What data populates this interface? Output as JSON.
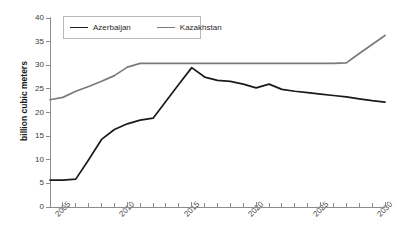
{
  "chart_data": {
    "type": "line",
    "title": "",
    "subtitle": "",
    "xlabel": "",
    "ylabel": "billion cubic meters",
    "xlim": [
      2004,
      2030
    ],
    "ylim": [
      0,
      40
    ],
    "yticks": [
      0,
      5,
      10,
      15,
      20,
      25,
      30,
      35,
      40
    ],
    "ytick_labels": [
      "0",
      "5",
      "10",
      "15",
      "20",
      "25",
      "30",
      "35",
      "40"
    ],
    "xticks": [
      2005,
      2010,
      2015,
      2020,
      2025,
      2030
    ],
    "xtick_labels": [
      "2005",
      "2010",
      "2015",
      "2020",
      "2025",
      "2030"
    ],
    "x_minor_tick_step": 1,
    "grid": false,
    "legend_position": "top-left-inside",
    "x": [
      2004,
      2005,
      2006,
      2007,
      2008,
      2009,
      2010,
      2011,
      2012,
      2013,
      2014,
      2015,
      2016,
      2017,
      2018,
      2019,
      2020,
      2021,
      2022,
      2023,
      2024,
      2025,
      2026,
      2027,
      2028,
      2029,
      2030
    ],
    "series": [
      {
        "name": "Azerbaijan",
        "color": "#1a1a1a",
        "width": 1.7,
        "values": [
          5.7,
          5.7,
          5.9,
          10.0,
          14.3,
          16.4,
          17.6,
          18.4,
          18.8,
          22.4,
          26.0,
          29.5,
          27.5,
          26.8,
          26.6,
          26.0,
          25.2,
          26.0,
          24.9,
          24.5,
          24.2,
          23.9,
          23.6,
          23.3,
          22.9,
          22.5,
          22.2
        ]
      },
      {
        "name": "Kazakhstan",
        "color": "#7a7a7a",
        "width": 1.7,
        "values": [
          22.7,
          23.2,
          24.5,
          25.5,
          26.6,
          27.8,
          29.6,
          30.4,
          30.4,
          30.4,
          30.4,
          30.4,
          30.4,
          30.4,
          30.4,
          30.4,
          30.4,
          30.4,
          30.4,
          30.4,
          30.4,
          30.4,
          30.4,
          30.5,
          32.5,
          34.4,
          36.3
        ]
      }
    ],
    "legend": [
      {
        "label": "Azerbaijan",
        "color": "#1a1a1a"
      },
      {
        "label": "Kazakhstan",
        "color": "#7a7a7a"
      }
    ],
    "axis_color": "#8c8c8c"
  }
}
